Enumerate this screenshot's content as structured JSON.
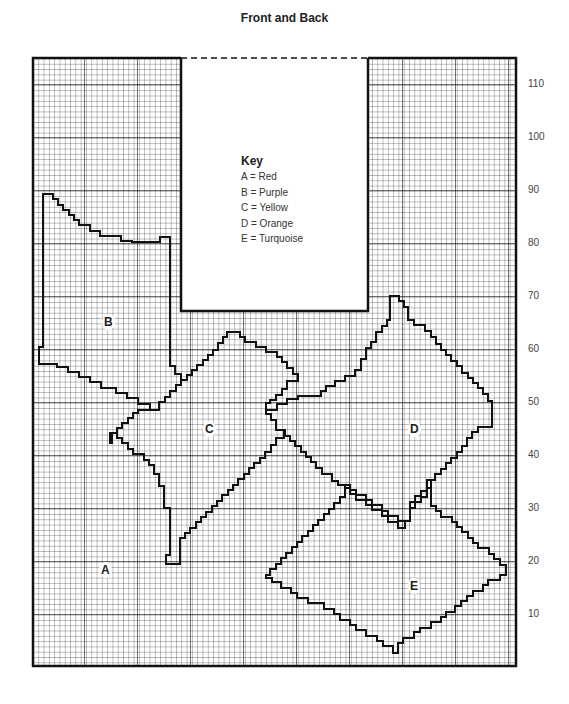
{
  "title": "Front and Back",
  "key": {
    "heading": "Key",
    "items": [
      "A = Red",
      "B = Purple",
      "C = Yellow",
      "D = Orange",
      "E = Turquoise"
    ]
  },
  "regions": {
    "A": "A",
    "B": "B",
    "C": "C",
    "D": "D",
    "E": "E"
  },
  "axis": {
    "labels": [
      "110",
      "100",
      "90",
      "80",
      "70",
      "60",
      "50",
      "40",
      "30",
      "20",
      "10"
    ]
  },
  "colors": {
    "A": "Red",
    "B": "Purple",
    "C": "Yellow",
    "D": "Orange",
    "E": "Turquoise"
  }
}
